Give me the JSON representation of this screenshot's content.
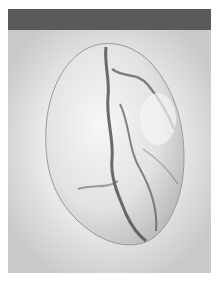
{
  "image": {
    "subject": "polished marble pebble",
    "style": "grayscale photograph",
    "colors": {
      "header_band": "#5a5a5a",
      "background_center": "#ffffff",
      "background_edge": "#c9c9c9",
      "stone_base": "#e6e6e6",
      "veins": "#4a4a4a"
    }
  }
}
